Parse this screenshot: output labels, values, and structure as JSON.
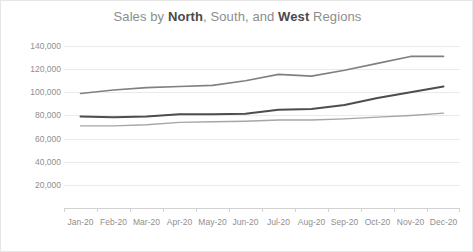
{
  "chart_data": {
    "type": "line",
    "title": "Sales by North, South, and West Regions",
    "title_parts": [
      {
        "text": "Sales by ",
        "bold": false
      },
      {
        "text": "North",
        "bold": true
      },
      {
        "text": ", South, and ",
        "bold": false
      },
      {
        "text": "West",
        "bold": true
      },
      {
        "text": " Regions",
        "bold": false
      }
    ],
    "categories": [
      "Jan-20",
      "Feb-20",
      "Mar-20",
      "Apr-20",
      "May-20",
      "Jun-20",
      "Jul-20",
      "Aug-20",
      "Sep-20",
      "Oct-20",
      "Nov-20",
      "Dec-20"
    ],
    "series": [
      {
        "name": "South",
        "color": "#808080",
        "width": 1.6,
        "values": [
          99000,
          102000,
          104000,
          105000,
          106000,
          110000,
          115500,
          114000,
          119000,
          125000,
          131000,
          131000
        ]
      },
      {
        "name": "North",
        "color": "#4d4d4d",
        "width": 2.0,
        "values": [
          79000,
          78500,
          79000,
          81000,
          81000,
          81500,
          85000,
          85500,
          89000,
          95000,
          100000,
          105000
        ]
      },
      {
        "name": "West",
        "color": "#a6a6a6",
        "width": 1.4,
        "values": [
          71000,
          71000,
          72000,
          74000,
          74500,
          75000,
          76000,
          76000,
          77000,
          78500,
          80000,
          82000
        ]
      }
    ],
    "ylabel": "",
    "xlabel": "",
    "ylim": [
      0,
      140000
    ],
    "yticks": [
      "20,000",
      "40,000",
      "60,000",
      "80,000",
      "100,000",
      "120,000",
      "140,000"
    ],
    "ytick_values": [
      20000,
      40000,
      60000,
      80000,
      100000,
      120000,
      140000
    ],
    "grid": true,
    "legend": "none",
    "colors": {
      "grid": "#eaeaea",
      "axis": "#d2d2d2",
      "tick_text": "#8f8f8f",
      "title_bold": "#4a4a4a",
      "title_normal": "#8d8d8d",
      "background": "#ffffff",
      "border": "#e6e6e6"
    }
  }
}
